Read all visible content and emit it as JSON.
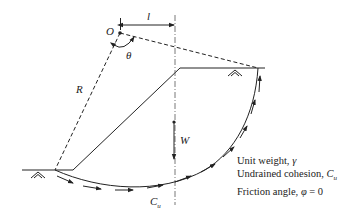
{
  "diagram": {
    "labels": {
      "center": "O",
      "lever_arm": "l",
      "angle": "θ",
      "radius": "R",
      "weight": "W",
      "cohesion_along_arc": "C",
      "cohesion_subscript": "u"
    },
    "properties": [
      {
        "label": "Unit weight, ",
        "symbol": "γ",
        "subscript": ""
      },
      {
        "label": "Undrained cohesion, ",
        "symbol": "C",
        "subscript": "u"
      },
      {
        "label": "Friction angle, ",
        "symbol": "φ",
        "subscript": "",
        "suffix": " = 0"
      }
    ],
    "icons": [
      "ground-surface-icon-left",
      "ground-surface-icon-crest"
    ]
  }
}
